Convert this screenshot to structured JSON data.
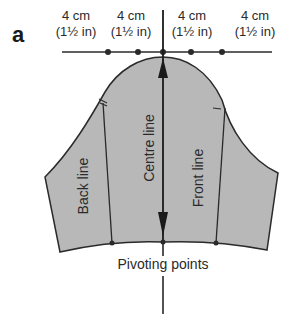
{
  "figure": {
    "letter": "a",
    "measurements": [
      {
        "metric": "4 cm",
        "imperial": "(1½ in)"
      },
      {
        "metric": "4 cm",
        "imperial": "(1½ in)"
      },
      {
        "metric": "4 cm",
        "imperial": "(1½ in)"
      },
      {
        "metric": "4 cm",
        "imperial": "(1½ in)"
      }
    ],
    "lines": {
      "back": "Back line",
      "centre": "Centre line",
      "front": "Front line"
    },
    "pivot_label": "Pivoting points",
    "colors": {
      "fill": "#b8b8b8",
      "stroke": "#2a2a2a"
    }
  }
}
